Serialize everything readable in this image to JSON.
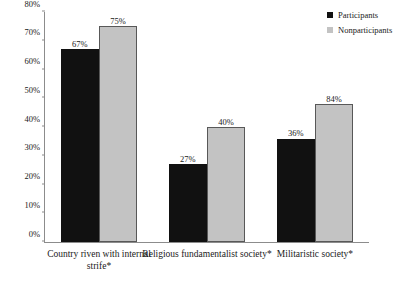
{
  "chart_data": {
    "type": "bar",
    "title": "",
    "xlabel": "",
    "ylabel": "",
    "ylim": [
      0,
      80
    ],
    "ytick_labels": [
      "0%",
      "10%",
      "20%",
      "30%",
      "40%",
      "50%",
      "60%",
      "70%",
      "80%"
    ],
    "ytick_values": [
      0,
      10,
      20,
      30,
      40,
      50,
      60,
      70,
      80
    ],
    "grid": false,
    "legend_position": "top-right",
    "categories": [
      "Country riven with internal strife*",
      "Religious fundamentalist society*",
      "Militaristic society*"
    ],
    "series": [
      {
        "name": "Participants",
        "color": "#111111",
        "values": [
          67,
          27,
          36
        ],
        "labels": [
          "67%",
          "27%",
          "36%"
        ],
        "plotted_heights": [
          67,
          27,
          36
        ]
      },
      {
        "name": "Nonparticipants",
        "color": "#c3c3c3",
        "values": [
          75,
          40,
          84
        ],
        "labels": [
          "75%",
          "40%",
          "84%"
        ],
        "plotted_heights": [
          75,
          40,
          48
        ]
      }
    ]
  },
  "legend": {
    "items": [
      {
        "label": "Participants",
        "color": "#111111"
      },
      {
        "label": "Nonparticipants",
        "color": "#c3c3c3"
      }
    ]
  }
}
